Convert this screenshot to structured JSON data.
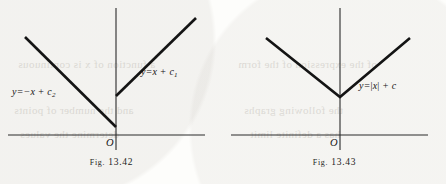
{
  "page": {
    "background_color": "#fdfdfb",
    "ink_color": "#141414",
    "axis_color": "#2a2a2a",
    "ghost_text_color": "#b9b5ad"
  },
  "figures": [
    {
      "id": "fig-13-42",
      "caption_prefix": "Fig.",
      "caption_number": "13.42",
      "caption": "Fig. 13.42",
      "origin_label": "O",
      "axes": {
        "x_axis": {
          "x1": 8,
          "y1": 135,
          "x2": 205,
          "y2": 135
        },
        "y_axis": {
          "x1": 116,
          "y1": 8,
          "x2": 116,
          "y2": 150
        }
      },
      "curves": [
        {
          "name": "left-branch",
          "equation_text": "y=-x + c2",
          "equation_parts": {
            "lhs": "y",
            "eq": "=",
            "slope": "-x",
            "plus": "+",
            "const": "c",
            "subscript": "2"
          },
          "label_x": 12,
          "label_y": 86,
          "points": [
            {
              "x": 25,
              "y": 37
            },
            {
              "x": 116,
              "y": 127
            }
          ]
        },
        {
          "name": "right-branch",
          "equation_text": "y=x + c1",
          "equation_parts": {
            "lhs": "y",
            "eq": "=",
            "slope": "x",
            "plus": "+",
            "const": "c",
            "subscript": "1"
          },
          "label_x": 141,
          "label_y": 66,
          "points": [
            {
              "x": 116,
              "y": 96
            },
            {
              "x": 196,
              "y": 18
            }
          ]
        }
      ],
      "origin_label_x": 106,
      "origin_label_y": 137
    },
    {
      "id": "fig-13-43",
      "caption_prefix": "Fig.",
      "caption_number": "13.43",
      "caption": "Fig. 13.43",
      "origin_label": "O",
      "axes": {
        "x_axis": {
          "x1": 8,
          "y1": 135,
          "x2": 205,
          "y2": 135
        },
        "y_axis": {
          "x1": 117,
          "y1": 8,
          "x2": 117,
          "y2": 150
        }
      },
      "curves": [
        {
          "name": "absolute-value-v",
          "equation_text": "y=|x| + c",
          "equation_parts": {
            "lhs": "y",
            "eq": "=",
            "slope": "|x|",
            "plus": "+",
            "const": "c",
            "subscript": ""
          },
          "label_x": 136,
          "label_y": 80,
          "points": [
            {
              "x": 43,
              "y": 38
            },
            {
              "x": 117,
              "y": 97
            },
            {
              "x": 187,
              "y": 38
            }
          ]
        }
      ],
      "origin_label_x": 107,
      "origin_label_y": 137
    }
  ],
  "background_ghost_text": [
    {
      "text": "a function of x is continuous",
      "x": 18,
      "y": 58,
      "size": 11
    },
    {
      "text": "of the expression of the form",
      "x": 238,
      "y": 58,
      "size": 11
    },
    {
      "text": "and the number of points",
      "x": 14,
      "y": 104,
      "size": 11
    },
    {
      "text": "the following graphs",
      "x": 244,
      "y": 104,
      "size": 11
    },
    {
      "text": "determine the values",
      "x": 20,
      "y": 128,
      "size": 11
    },
    {
      "text": "has a definite limit",
      "x": 250,
      "y": 128,
      "size": 11
    }
  ]
}
